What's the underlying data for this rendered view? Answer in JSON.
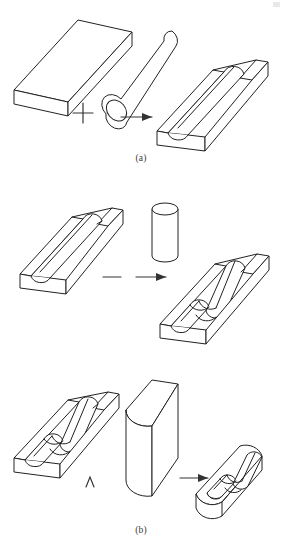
{
  "figure": {
    "line_color": "#222222",
    "background_color": "#ffffff",
    "panels": [
      {
        "id": "a",
        "caption": "(a)",
        "operator": "+",
        "operator_name": "union-plus-operator",
        "operands": [
          {
            "name": "rectangular-plate",
            "shape": "flat rectangular block"
          },
          {
            "name": "horizontal-cylinder",
            "shape": "long cylindrical rod"
          }
        ],
        "result": {
          "name": "plate-with-ridge",
          "shape": "plate with half-cylinder ridge on top"
        }
      },
      {
        "id": "b",
        "caption": "(b)",
        "operator": "−",
        "operator_name": "difference-minus-operator",
        "operands": [
          {
            "name": "plate-with-ridge",
            "shape": "plate with half-cylinder ridge on top"
          },
          {
            "name": "vertical-cylinder",
            "shape": "short upright cylinder"
          }
        ],
        "result": {
          "name": "plate-with-notched-ridge",
          "shape": "plate with cylindrical notch cut in the ridge"
        }
      },
      {
        "id": "c",
        "caption": "(c)",
        "operator": "∧",
        "operator_name": "intersection-wedge-operator",
        "operands": [
          {
            "name": "plate-with-notched-ridge",
            "shape": "plate with cylindrical notch cut in the ridge"
          },
          {
            "name": "rounded-end-block",
            "shape": "tall prism with one rounded end"
          }
        ],
        "result": {
          "name": "rounded-end-plate-section",
          "shape": "stadium-shaped plate section with notched ridge"
        }
      }
    ],
    "arrow_label": "→"
  }
}
